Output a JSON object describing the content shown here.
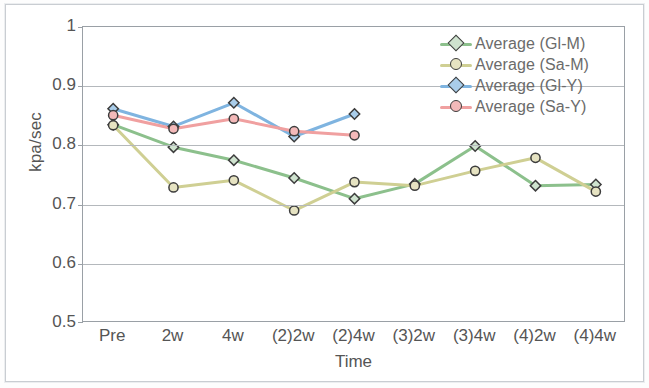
{
  "chart_data": {
    "type": "line",
    "title": "",
    "xlabel": "Time",
    "ylabel": "kpa/sec",
    "categories": [
      "Pre",
      "2w",
      "4w",
      "(2)2w",
      "(2)4w",
      "(3)2w",
      "(3)4w",
      "(4)2w",
      "(4)4w"
    ],
    "ylim": [
      0.5,
      1.0
    ],
    "yticks": [
      "0.5",
      "0.6",
      "0.7",
      "0.8",
      "0.9",
      "1"
    ],
    "ytick_values": [
      0.5,
      0.6,
      0.7,
      0.8,
      0.9,
      1.0
    ],
    "grid": "horizontal",
    "legend_position": "top-right",
    "series": [
      {
        "name": "Average (Gl-M)",
        "color": "#8cc08c",
        "marker": "diamond",
        "marker_fill": "#cfe3cf",
        "values": [
          0.835,
          0.797,
          0.775,
          0.745,
          0.71,
          0.735,
          0.799,
          0.732,
          0.734
        ]
      },
      {
        "name": "Average (Sa-M)",
        "color": "#cfcf93",
        "marker": "circle",
        "marker_fill": "#e6e3c2",
        "values": [
          0.834,
          0.729,
          0.741,
          0.69,
          0.738,
          0.732,
          0.757,
          0.779,
          0.722
        ]
      },
      {
        "name": "Average (Gl-Y)",
        "color": "#7fb4e0",
        "marker": "diamond",
        "marker_fill": "#a9cdea",
        "values": [
          0.862,
          0.832,
          0.872,
          0.815,
          0.853,
          null,
          null,
          null,
          null
        ]
      },
      {
        "name": "Average (Sa-Y)",
        "color": "#f0a0a0",
        "marker": "circle",
        "marker_fill": "#f3b9b9",
        "values": [
          0.851,
          0.828,
          0.845,
          0.824,
          0.817,
          null,
          null,
          null,
          null
        ]
      }
    ]
  },
  "legend": {
    "items": [
      {
        "label": "Average  (Gl-M)"
      },
      {
        "label": "Average  (Sa-M)"
      },
      {
        "label": "Average  (Gl-Y)"
      },
      {
        "label": "Average  (Sa-Y)"
      }
    ]
  },
  "colors": {
    "frame": "#9aa0a6",
    "gridline": "#b4b8bc",
    "text": "#555555",
    "page_border": "#c9cdd2"
  }
}
